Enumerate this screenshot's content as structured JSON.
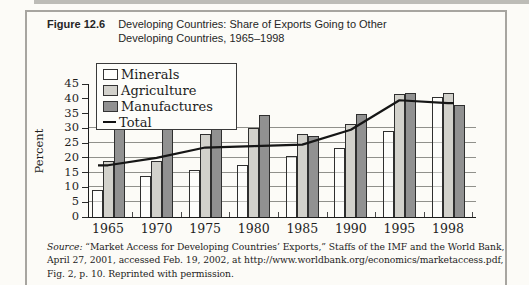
{
  "figure": {
    "label": "Figure 12.6",
    "title_line1": "Developing Countries: Share of Exports Going to Other",
    "title_line2": "Developing Countries, 1965–1998"
  },
  "chart_data": {
    "type": "bar",
    "categories": [
      "1965",
      "1970",
      "1975",
      "1980",
      "1985",
      "1990",
      "1995",
      "1998"
    ],
    "series": [
      {
        "name": "Minerals",
        "type": "bar",
        "color": "rgba(255,255,255,0.45)",
        "values": [
          9,
          14,
          16,
          17.5,
          20.5,
          23.5,
          29,
          40.5
        ]
      },
      {
        "name": "Agriculture",
        "type": "bar",
        "color": "#d2d1cb",
        "values": [
          19,
          19,
          28,
          30,
          28,
          31.5,
          41.5,
          42
        ]
      },
      {
        "name": "Manufactures",
        "type": "bar",
        "color": "#919191",
        "values": [
          32,
          31,
          36,
          34.5,
          27.5,
          35,
          42,
          38
        ]
      },
      {
        "name": "Total",
        "type": "line",
        "color": "#161616",
        "values": [
          17.5,
          20,
          23.5,
          24,
          24.5,
          29.5,
          39.5,
          38.5
        ]
      }
    ],
    "title": "Developing Countries: Share of Exports Going to Other Developing Countries, 1965–1998",
    "xlabel": "",
    "ylabel": "Percent",
    "ylim": [
      0,
      45
    ],
    "ytick_step": 5,
    "gridlines_at": [
      5,
      10,
      15,
      20,
      25,
      30
    ],
    "legend_position": "top-left",
    "legend_entries": [
      "Minerals",
      "Agriculture",
      "Manufactures",
      "Total"
    ]
  },
  "source": {
    "line1_italic": "Source:",
    "line1_rest": " “Market Access for Developing Countries’ Exports,” Staffs of the IMF and the World Bank,",
    "line2": "April 27, 2001, accessed Feb. 19, 2002, at http://www.worldbank.org/economics/marketaccess.pdf,",
    "line3": "Fig. 2, p. 10. Reprinted with permission."
  }
}
